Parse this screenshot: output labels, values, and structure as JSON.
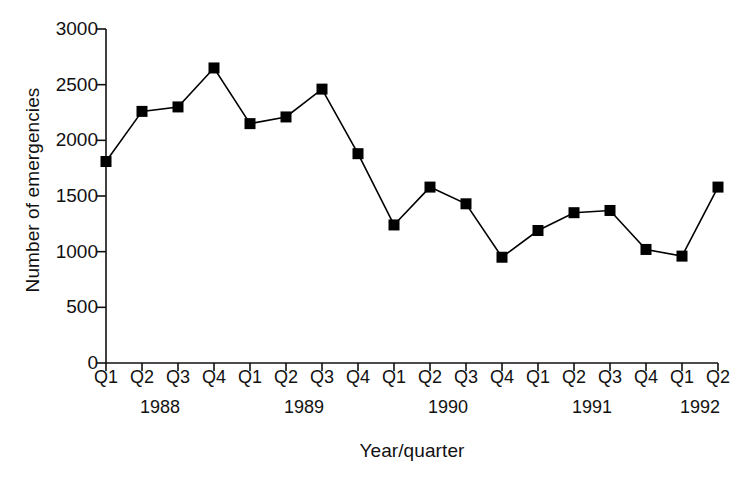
{
  "chart_data": {
    "type": "line",
    "title": "",
    "xlabel": "Year/quarter",
    "ylabel": "Number of emergencies",
    "categories": [
      "Q1",
      "Q2",
      "Q3",
      "Q4",
      "Q1",
      "Q2",
      "Q3",
      "Q4",
      "Q1",
      "Q2",
      "Q3",
      "Q4",
      "Q1",
      "Q2",
      "Q3",
      "Q4",
      "Q1",
      "Q2"
    ],
    "group_labels": [
      "1988",
      "1989",
      "1990",
      "1991",
      "1992"
    ],
    "group_spans": [
      4,
      4,
      4,
      4,
      2
    ],
    "series": [
      {
        "name": "Number of emergencies",
        "marker": "filled-square",
        "color": "#000000",
        "values": [
          1810,
          2260,
          2300,
          2650,
          2150,
          2210,
          2460,
          1880,
          1240,
          1580,
          1430,
          950,
          1190,
          1350,
          1370,
          1020,
          960,
          1580
        ]
      }
    ],
    "ylim": [
      0,
      3000
    ],
    "yticks": [
      0,
      500,
      1000,
      1500,
      2000,
      2500,
      3000
    ],
    "ytick_labels": [
      "0",
      "500",
      "1000",
      "1500",
      "2000",
      "2500",
      "3000"
    ],
    "grid": false,
    "legend": false
  }
}
